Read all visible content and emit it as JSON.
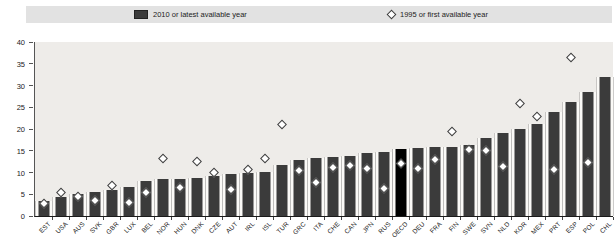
{
  "legend": {
    "bar_label": "2010 or latest available year",
    "diamond_label": "1995 or first available year"
  },
  "chart_data": {
    "type": "bar",
    "title": "",
    "xlabel": "",
    "ylabel": "",
    "ylim": [
      0,
      40
    ],
    "yticks": [
      0,
      5,
      10,
      15,
      20,
      25,
      30,
      35,
      40
    ],
    "grid": false,
    "legend_position": "top",
    "highlight_category": "OECD",
    "categories": [
      "EST",
      "USA",
      "AUS",
      "SVK",
      "GBR",
      "LUX",
      "BEL",
      "NOR",
      "HUN",
      "DNK",
      "CZE",
      "AUT",
      "IRL",
      "ISL",
      "TUR",
      "GRC",
      "ITA",
      "CHE",
      "CAN",
      "JPN",
      "RUS",
      "OECD",
      "DEU",
      "FRA",
      "FIN",
      "SWE",
      "SVN",
      "NLD",
      "KOR",
      "MEX",
      "PRT",
      "ESP",
      "POL",
      "CHL"
    ],
    "series": [
      {
        "name": "2010 or latest available year",
        "marker": "bar",
        "values": [
          3.5,
          4.4,
          5.1,
          5.6,
          6.0,
          6.6,
          8.1,
          8.4,
          8.6,
          8.8,
          9.2,
          9.6,
          10.0,
          10.2,
          11.8,
          12.9,
          13.3,
          13.6,
          13.8,
          14.4,
          14.8,
          15.3,
          15.6,
          15.8,
          15.9,
          16.3,
          17.9,
          19.0,
          20.0,
          21.2,
          24.0,
          26.1,
          28.6,
          32.0
        ]
      },
      {
        "name": "1995 or first available year",
        "marker": "diamond",
        "values": [
          2.7,
          5.2,
          4.4,
          3.5,
          7.0,
          3.1,
          5.4,
          13.1,
          6.5,
          12.4,
          9.8,
          6.0,
          10.6,
          13.1,
          21.0,
          10.4,
          7.7,
          11.1,
          11.5,
          10.7,
          6.1,
          11.9,
          10.9,
          12.9,
          19.3,
          15.2,
          14.9,
          11.3,
          25.8,
          22.7,
          10.6,
          36.3,
          12.3,
          null
        ]
      }
    ],
    "colors": {
      "bar": "#3b3b3b",
      "bar_highlight": "#000000",
      "diamond_fill": "#ffffff",
      "diamond_stroke": "#3b3b3b",
      "plot_background": "#eeece9",
      "legend_background": "#e2e2e2"
    }
  }
}
